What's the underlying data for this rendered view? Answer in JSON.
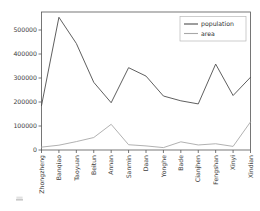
{
  "chart_data": {
    "type": "line",
    "title": "",
    "xlabel": "",
    "ylabel": "",
    "categories": [
      "Zhongzheng",
      "Banqiao",
      "Taoyuan",
      "Beitun",
      "Annan",
      "Sanmin",
      "Daan",
      "Yonghe",
      "Bade",
      "Cianjhen",
      "Fengshan",
      "Xinyi",
      "Xindian"
    ],
    "series": [
      {
        "name": "population",
        "color": "#4d4d4d",
        "values": [
          185000,
          553000,
          444000,
          282000,
          197000,
          343000,
          308000,
          225000,
          205000,
          192000,
          358000,
          227000,
          303000
        ]
      },
      {
        "name": "area",
        "color": "#a8a8a8",
        "values": [
          12000,
          20000,
          35000,
          52000,
          107000,
          22000,
          17000,
          10000,
          34000,
          21000,
          26000,
          15000,
          117000
        ]
      }
    ],
    "ylim": [
      0,
      575000
    ],
    "yticks": [
      0,
      100000,
      200000,
      300000,
      400000,
      500000
    ],
    "ytick_labels": [
      "0",
      "100000",
      "200000",
      "300000",
      "400000",
      "500000"
    ],
    "grid": false,
    "legend_position": "upper right",
    "legend_entries": [
      "population",
      "area"
    ],
    "xtick_rotation": 90
  },
  "figure": {
    "background_color": "#ffffff",
    "axes_edge_color": "#555555",
    "tick_color": "#555555",
    "label_color": "#3c3c3c"
  },
  "artifact": {
    "caption": ""
  }
}
